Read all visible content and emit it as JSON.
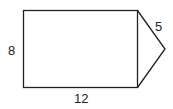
{
  "diagram": {
    "type": "composite-shape",
    "shapes": [
      {
        "name": "rectangle",
        "width_label": "12",
        "height_label": "8"
      },
      {
        "name": "triangle",
        "side_label": "5"
      }
    ],
    "labels": {
      "left_side": "8",
      "bottom_side": "12",
      "triangle_side": "5"
    },
    "colors": {
      "stroke": "#222222",
      "background": "#ffffff"
    }
  }
}
